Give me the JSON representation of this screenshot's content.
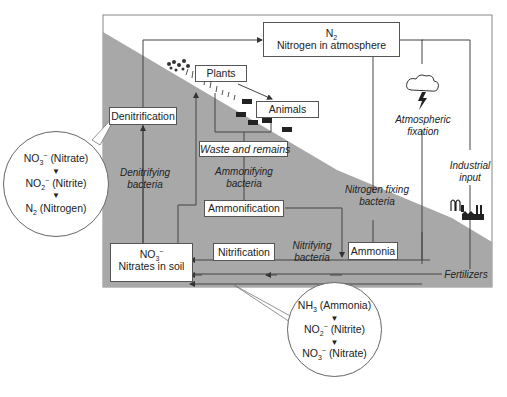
{
  "diagram": {
    "colors": {
      "ground": "#a9a9a9",
      "sky": "#ffffff",
      "line": "#444444"
    },
    "nodes": {
      "n2": {
        "formula": "N",
        "formula_sub": "2",
        "label": "Nitrogen in atmosphere"
      },
      "plants": {
        "label": "Plants"
      },
      "animals": {
        "label": "Animals"
      },
      "denitrification": {
        "label": "Denitrification"
      },
      "waste": {
        "label": "Waste and remains"
      },
      "ammonification": {
        "label": "Ammonification"
      },
      "nitrification": {
        "label": "Nitrification"
      },
      "ammonia": {
        "label": "Ammonia"
      },
      "nitrates": {
        "formula": "NO",
        "formula_sub": "3",
        "formula_sup": "−",
        "label": "Nitrates in soil"
      }
    },
    "edge_labels": {
      "denitrifying_1": "Denitrifying",
      "denitrifying_2": "bacteria",
      "ammonifying_1": "Ammonifying",
      "ammonifying_2": "bacteria",
      "nitrogen_fixing_1": "Nitrogen fixing",
      "nitrogen_fixing_2": "bacteria",
      "nitrifying_1": "Nitrifying",
      "nitrifying_2": "bacteria",
      "atmospheric_1": "Atmospheric",
      "atmospheric_2": "fixation",
      "industrial_1": "Industrial",
      "industrial_2": "input",
      "fertilizers": "Fertilizers"
    },
    "callouts": {
      "denitrification_steps": [
        {
          "formula": "NO",
          "sub": "3",
          "sup": "−",
          "name": "(Nitrate)"
        },
        {
          "formula": "NO",
          "sub": "2",
          "sup": "−",
          "name": "(Nitrite)"
        },
        {
          "formula": "N",
          "sub": "2",
          "sup": "",
          "name": "(Nitrogen)"
        }
      ],
      "nitrification_steps": [
        {
          "formula": "NH",
          "sub": "3",
          "sup": "",
          "name": "(Ammonia)"
        },
        {
          "formula": "NO",
          "sub": "2",
          "sup": "−",
          "name": "(Nitrite)"
        },
        {
          "formula": "NO",
          "sub": "3",
          "sup": "−",
          "name": "(Nitrate)"
        }
      ],
      "arrow_glyph": "▼"
    },
    "icons": [
      "plants-icon",
      "animals-icon",
      "storm-cloud-icon",
      "factory-icon"
    ]
  }
}
